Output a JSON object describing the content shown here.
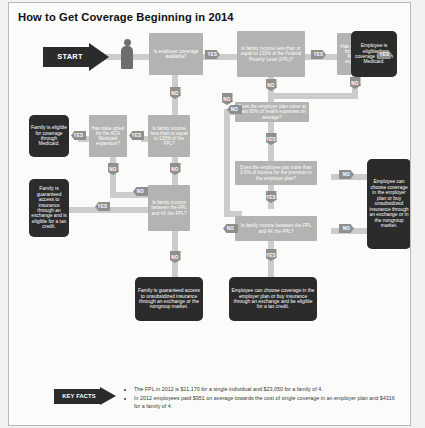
{
  "page": {
    "title": "How to Get Coverage Beginning in 2014",
    "notes_label": "NOTES"
  },
  "start": {
    "label": "START",
    "icon": "person-icon"
  },
  "decisions": [
    {
      "id": "d1",
      "text": "Is employer coverage available?"
    },
    {
      "id": "d2",
      "text": "Is family income less than or equal to 133% of the Federal Poverty Level (FPL)?"
    },
    {
      "id": "d3",
      "text": "Has state opted for the ACA Medicaid expansion?"
    },
    {
      "id": "d4",
      "text": "Is family income less than or equal to 133% of the FPL?"
    },
    {
      "id": "d5",
      "text": "Has state opted for the ACA Medicaid expansion?"
    },
    {
      "id": "d6",
      "text": "Is family income between the FPL and 4X the FPL?"
    },
    {
      "id": "d7",
      "text": "Does the employer plan cover at least 60% of health expenses on average?"
    },
    {
      "id": "d8",
      "text": "Does the employee pay more than 9.5% of income for the premium in the employer plan?"
    },
    {
      "id": "d9",
      "text": "Is family income between the FPL and 4X the FPL?"
    }
  ],
  "outcomes": [
    {
      "id": "o1",
      "text": "Employee is eligible for coverage through Medicaid."
    },
    {
      "id": "o2",
      "text": "Family is eligible for coverage through Medicaid."
    },
    {
      "id": "o3",
      "text": "Family is guaranteed access to insurance through an exchange and is eligible for a tax credit."
    },
    {
      "id": "o4",
      "text": "Family is guaranteed access to unsubsidized insurance through an exchange or the nongroup market."
    },
    {
      "id": "o5",
      "text": "Employee can choose coverage in the employer plan or buy insurance through an exchange and be eligible for a tax credit."
    },
    {
      "id": "o6",
      "text": "Employee can choose coverage in the employer plan or buy unsubsidized insurance through an exchange or in the nongroup market."
    }
  ],
  "edge_labels": {
    "yes": "YES",
    "no": "NO"
  },
  "key_facts": {
    "label": "KEY FACTS",
    "items": [
      "The FPL in 2012 is $11,170 for a single individual and $23,050 for a family of 4.",
      "In 2012 employees paid $951 on average towards the cost of single coverage in an employer plan and $4316 for a family of 4."
    ]
  },
  "colors": {
    "outcome_box": "#2b2b2b",
    "decision_box": "#b3b3b1",
    "connector": "#cccccc",
    "chip": "#8f8f8d"
  }
}
